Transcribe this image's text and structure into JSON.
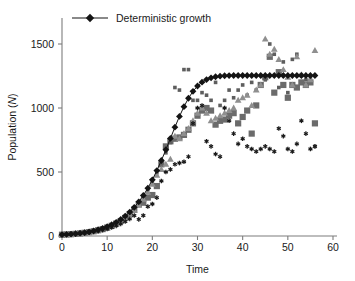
{
  "chart_data": {
    "type": "scatter",
    "title": "",
    "xlabel": "Time",
    "ylabel": "Population (N)",
    "ylabel_plain": "Population (",
    "ylabel_italic": "N",
    "ylabel_tail": ")",
    "xlim": [
      0,
      60
    ],
    "ylim": [
      0,
      1700
    ],
    "xticks": [
      0,
      10,
      20,
      30,
      40,
      50,
      60
    ],
    "yticks": [
      0,
      500,
      1000,
      1500
    ],
    "grid": false,
    "legend": {
      "position": "top-left-inside",
      "entries": [
        {
          "label": "Deterministic growth",
          "marker": "diamond",
          "color": "#141414",
          "line": true
        }
      ]
    },
    "series": [
      {
        "name": "Deterministic growth",
        "marker": "diamond",
        "color": "#141414",
        "size": 3.4,
        "line": true,
        "x": [
          0,
          1,
          2,
          3,
          4,
          5,
          6,
          7,
          8,
          9,
          10,
          11,
          12,
          13,
          14,
          15,
          16,
          17,
          18,
          19,
          20,
          21,
          22,
          23,
          24,
          25,
          26,
          27,
          28,
          29,
          30,
          31,
          32,
          33,
          34,
          35,
          36,
          37,
          38,
          39,
          40,
          41,
          42,
          43,
          44,
          45,
          46,
          47,
          48,
          49,
          50,
          51,
          52,
          53,
          54,
          55,
          56
        ],
        "y": [
          10,
          12,
          15,
          18,
          22,
          27,
          33,
          40,
          49,
          60,
          73,
          88,
          107,
          129,
          156,
          187,
          224,
          267,
          317,
          374,
          439,
          511,
          590,
          674,
          762,
          850,
          934,
          1010,
          1076,
          1130,
          1172,
          1202,
          1222,
          1236,
          1244,
          1249,
          1252,
          1253,
          1254,
          1254,
          1254,
          1254,
          1254,
          1254,
          1254,
          1254,
          1254,
          1254,
          1254,
          1254,
          1254,
          1254,
          1254,
          1254,
          1254,
          1254,
          1254
        ]
      },
      {
        "name": "Stochastic replicate 1 (large square)",
        "marker": "square",
        "color": "#6b6b6b",
        "size": 6.2,
        "line": false,
        "x": [
          0,
          1,
          2,
          3,
          4,
          5,
          6,
          7,
          8,
          9,
          10,
          11,
          12,
          13,
          14,
          15,
          16,
          17,
          18,
          19,
          20,
          21,
          22,
          23,
          24,
          25,
          26,
          27,
          28,
          29,
          30,
          31,
          32,
          33,
          34,
          35,
          36,
          37,
          38,
          39,
          40,
          41,
          42,
          43,
          44,
          45,
          46,
          47,
          48,
          49,
          50,
          51,
          52,
          53,
          54,
          55,
          56
        ],
        "y": [
          10,
          12,
          14,
          17,
          20,
          25,
          30,
          37,
          45,
          54,
          66,
          80,
          97,
          117,
          141,
          170,
          205,
          246,
          260,
          300,
          320,
          390,
          560,
          700,
          740,
          760,
          770,
          790,
          830,
          880,
          940,
          980,
          1000,
          980,
          870,
          900,
          910,
          940,
          960,
          880,
          930,
          980,
          800,
          1020,
          1180,
          1240,
          1400,
          1120,
          1280,
          1180,
          1080,
          1180,
          1160,
          1200,
          1180,
          1200,
          880
        ]
      },
      {
        "name": "Stochastic replicate 2 (small square)",
        "marker": "square-small",
        "color": "#5e5e5e",
        "size": 3.6,
        "line": false,
        "x": [
          0,
          1,
          2,
          3,
          4,
          5,
          6,
          7,
          8,
          9,
          10,
          11,
          12,
          13,
          14,
          15,
          16,
          17,
          18,
          19,
          20,
          21,
          22,
          23,
          24,
          25,
          26,
          27,
          28,
          29,
          30,
          31,
          32,
          33,
          34,
          35,
          36,
          37,
          38,
          39,
          40,
          41,
          42,
          43,
          44,
          45,
          46,
          47,
          48,
          49,
          50,
          51,
          52,
          53,
          54,
          55,
          56
        ],
        "y": [
          10,
          12,
          15,
          18,
          21,
          26,
          32,
          39,
          47,
          57,
          70,
          85,
          103,
          124,
          150,
          180,
          216,
          259,
          307,
          362,
          424,
          494,
          570,
          650,
          730,
          1160,
          1140,
          1300,
          1300,
          1060,
          1060,
          1120,
          1100,
          1060,
          1200,
          1020,
          1060,
          1140,
          1080,
          1140,
          1180,
          1100,
          1200,
          1140,
          1180,
          1220,
          1500,
          1420,
          1160,
          1360,
          1120,
          1380,
          1420,
          1260,
          1220,
          1240,
          700
        ]
      },
      {
        "name": "Stochastic replicate 3 (triangle)",
        "marker": "triangle",
        "color": "#8f8f8f",
        "size": 5.6,
        "line": false,
        "x": [
          0,
          1,
          2,
          3,
          4,
          5,
          6,
          7,
          8,
          9,
          10,
          11,
          12,
          13,
          14,
          15,
          16,
          17,
          18,
          19,
          20,
          21,
          22,
          23,
          24,
          25,
          26,
          27,
          28,
          29,
          30,
          31,
          32,
          33,
          34,
          35,
          36,
          37,
          38,
          39,
          40,
          41,
          42,
          43,
          44,
          45,
          46,
          47,
          48,
          49,
          50,
          51,
          52,
          53,
          54,
          55,
          56
        ],
        "y": [
          10,
          12,
          14,
          17,
          20,
          24,
          29,
          36,
          44,
          53,
          64,
          78,
          95,
          115,
          139,
          168,
          202,
          242,
          288,
          342,
          404,
          474,
          520,
          560,
          600,
          780,
          760,
          800,
          840,
          900,
          960,
          1000,
          960,
          900,
          920,
          940,
          960,
          980,
          1000,
          1060,
          1080,
          1100,
          1020,
          1140,
          1180,
          1540,
          1420,
          1460,
          1380,
          1300,
          1240,
          1180,
          1400,
          1260,
          1180,
          1220,
          1450
        ]
      },
      {
        "name": "Stochastic replicate 4 (asterisk)",
        "marker": "asterisk",
        "color": "#1a1a1a",
        "size": 4.6,
        "line": false,
        "x": [
          0,
          1,
          2,
          3,
          4,
          5,
          6,
          7,
          8,
          9,
          10,
          11,
          12,
          13,
          14,
          15,
          16,
          17,
          18,
          19,
          20,
          21,
          22,
          23,
          24,
          25,
          26,
          27,
          28,
          29,
          30,
          31,
          32,
          33,
          34,
          35,
          36,
          37,
          38,
          39,
          40,
          41,
          42,
          43,
          44,
          45,
          46,
          47,
          48,
          49,
          50,
          51,
          52,
          53,
          54,
          55,
          56
        ],
        "y": [
          10,
          11,
          13,
          15,
          18,
          22,
          26,
          32,
          38,
          46,
          55,
          66,
          79,
          95,
          113,
          134,
          160,
          130,
          160,
          230,
          250,
          300,
          430,
          500,
          520,
          560,
          570,
          580,
          620,
          880,
          1000,
          1020,
          740,
          700,
          640,
          620,
          1000,
          900,
          800,
          720,
          760,
          700,
          680,
          660,
          680,
          700,
          680,
          660,
          840,
          780,
          680,
          660,
          720,
          900,
          800,
          680,
          700
        ]
      }
    ]
  }
}
